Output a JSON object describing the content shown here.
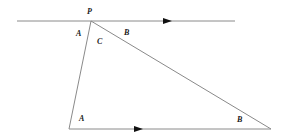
{
  "diagram": {
    "type": "geometry-triangle-parallel-lines",
    "colors": {
      "line": "#8a8a8a",
      "arrow": "#111111",
      "label": "#1a1a1a",
      "background": "#ffffff"
    },
    "points": {
      "P": {
        "label": "P",
        "x": 91,
        "y": 21
      },
      "bottom_left": {
        "x": 69,
        "y": 129
      },
      "bottom_right": {
        "x": 271,
        "y": 129
      }
    },
    "top_line": {
      "x1": 17,
      "y1": 21,
      "x2": 235,
      "y2": 21
    },
    "bottom_line": {
      "x1": 69,
      "y1": 129,
      "x2": 271,
      "y2": 129
    },
    "angle_labels": {
      "top_left_A": "A",
      "top_C": "C",
      "top_right_B": "B",
      "bottom_left_A": "A",
      "bottom_right_B": "B"
    },
    "vertex_label": "P"
  }
}
